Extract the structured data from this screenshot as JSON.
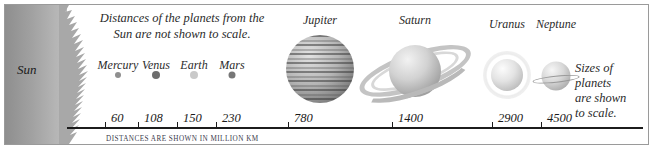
{
  "figure": {
    "header_note_line1": "Distances of the planets from the",
    "header_note_line2": "Sun are not shown to scale.",
    "right_note_line1": "Sizes of",
    "right_note_line2": "planets",
    "right_note_line3": "are shown",
    "right_note_line4": "to scale.",
    "axis_caption": "Distances are shown in million km",
    "sun_label": "Sun"
  },
  "chart_data": {
    "type": "scatter",
    "title": "Distances of the planets from the Sun are not shown to scale.",
    "xlabel": "Distances are shown in million km",
    "ylabel": "",
    "grid": false,
    "legend": "none",
    "annotations": [
      "Distances of the planets from the Sun are not shown to scale.",
      "Sizes of planets are shown to scale.",
      "Distances are shown in million km"
    ],
    "categories": [
      "Mercury",
      "Venus",
      "Earth",
      "Mars",
      "Jupiter",
      "Saturn",
      "Uranus",
      "Neptune"
    ],
    "values": [
      60,
      108,
      150,
      230,
      780,
      1400,
      2900,
      4500
    ],
    "tick_labels": [
      "60",
      "108",
      "150",
      "230",
      "780",
      "1400",
      "2900",
      "4500"
    ],
    "units": "million km",
    "bodies": [
      {
        "name": "Mercury",
        "distance": 60,
        "distance_label": "60",
        "label_x": 113,
        "label_y": 53,
        "body_x": 113,
        "body_y": 70,
        "body_size": 6,
        "tick_x": 100,
        "label_tick_x": 106,
        "render": "dot",
        "color": "#8f8f8f"
      },
      {
        "name": "Venus",
        "distance": 108,
        "distance_label": "108",
        "label_x": 151,
        "label_y": 53,
        "body_x": 151,
        "body_y": 70,
        "body_size": 8,
        "tick_x": 133,
        "label_tick_x": 139,
        "render": "dot",
        "color": "#6e6e6e"
      },
      {
        "name": "Earth",
        "distance": 150,
        "distance_label": "150",
        "label_x": 189,
        "label_y": 53,
        "body_x": 189,
        "body_y": 70,
        "body_size": 8,
        "tick_x": 172,
        "label_tick_x": 178,
        "render": "dot",
        "color": "#c9c9c9"
      },
      {
        "name": "Mars",
        "distance": 230,
        "distance_label": "230",
        "label_x": 227,
        "label_y": 53,
        "body_x": 227,
        "body_y": 70,
        "body_size": 7,
        "tick_x": 211,
        "label_tick_x": 217,
        "render": "dot",
        "color": "#777777"
      },
      {
        "name": "Jupiter",
        "distance": 780,
        "distance_label": "780",
        "label_x": 315,
        "label_y": 8,
        "body_x": 315,
        "body_y": 64,
        "body_size": 68,
        "tick_x": 283,
        "label_tick_x": 289,
        "render": "jupiter",
        "color": "#9b9b9b"
      },
      {
        "name": "Saturn",
        "distance": 1400,
        "distance_label": "1400",
        "label_x": 410,
        "label_y": 8,
        "body_x": 410,
        "body_y": 66,
        "body_size": 52,
        "tick_x": 387,
        "label_tick_x": 393,
        "render": "saturn",
        "color": "#c2c2c2"
      },
      {
        "name": "Uranus",
        "distance": 2900,
        "distance_label": "2900",
        "label_x": 502,
        "label_y": 12,
        "body_x": 502,
        "body_y": 70,
        "body_size": 32,
        "tick_x": 487,
        "label_tick_x": 493,
        "render": "uranus",
        "color": "#dedede"
      },
      {
        "name": "Neptune",
        "distance": 4500,
        "distance_label": "4500",
        "label_x": 551,
        "label_y": 12,
        "body_x": 551,
        "body_y": 71,
        "body_size": 29,
        "tick_x": 536,
        "label_tick_x": 542,
        "render": "neptune",
        "color": "#cfcfcf"
      }
    ]
  }
}
